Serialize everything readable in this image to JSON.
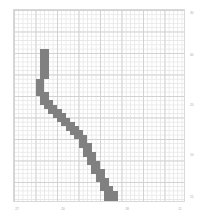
{
  "figure": {
    "background_color": "#ffffff",
    "plot_border_color": "#d9d9d9"
  },
  "chart_data": {
    "type": "heatmap",
    "title": "",
    "subtitle": "",
    "xlabel": "",
    "ylabel": "",
    "grid": true,
    "grid_minor_cell_px": 4.3,
    "grid_major_every": 5,
    "legend": null,
    "legend_position": "none",
    "fill_color": "#808080",
    "empty_color": "#ffffff",
    "annotation": "pixelated y-shaped glyph rendered as filled grid bins",
    "xlim": [
      27,
      11
    ],
    "ylim": [
      15,
      30
    ],
    "x_ticks": [
      {
        "label": "27",
        "value": 27,
        "px": 17
      },
      {
        "label": "20",
        "value": 20,
        "px": 63
      },
      {
        "label": "18",
        "value": 18,
        "px": 127
      },
      {
        "label": "11",
        "value": 11,
        "px": 180
      }
    ],
    "y_ticks": [
      {
        "label": "30",
        "value": 30,
        "px": 13
      },
      {
        "label": "40",
        "value": 40,
        "px": 55
      },
      {
        "label": "20",
        "value": 20,
        "px": 105
      },
      {
        "label": "10",
        "value": 10,
        "px": 155
      },
      {
        "label": "15",
        "value": 15,
        "px": 197
      }
    ],
    "grid_cols": 40,
    "grid_rows": 45,
    "cell_w": 4.3,
    "cell_h": 4.3,
    "filled_cells": [
      [
        55,
        14
      ],
      [
        55,
        15
      ],
      [
        55,
        16
      ],
      [
        54,
        14
      ],
      [
        54,
        15
      ],
      [
        54,
        16
      ],
      [
        53,
        14
      ],
      [
        53,
        15
      ],
      [
        53,
        16
      ],
      [
        53,
        17
      ],
      [
        52,
        15
      ],
      [
        52,
        16
      ],
      [
        52,
        17
      ],
      [
        52,
        18
      ],
      [
        51,
        16
      ],
      [
        51,
        17
      ],
      [
        51,
        18
      ],
      [
        50,
        16
      ],
      [
        50,
        17
      ],
      [
        50,
        18
      ],
      [
        49,
        17
      ],
      [
        49,
        18
      ],
      [
        49,
        19
      ],
      [
        48,
        18
      ],
      [
        48,
        19
      ],
      [
        48,
        20
      ],
      [
        47,
        19
      ],
      [
        47,
        20
      ],
      [
        46,
        19
      ],
      [
        46,
        20
      ],
      [
        46,
        21
      ],
      [
        45,
        20
      ],
      [
        45,
        21
      ],
      [
        45,
        22
      ],
      [
        44,
        21
      ],
      [
        44,
        22
      ],
      [
        43,
        21
      ],
      [
        43,
        22
      ],
      [
        43,
        23
      ],
      [
        56,
        28
      ],
      [
        56,
        29
      ],
      [
        56,
        30
      ],
      [
        55,
        28
      ],
      [
        55,
        29
      ],
      [
        55,
        30
      ],
      [
        54,
        27
      ],
      [
        54,
        28
      ],
      [
        54,
        29
      ],
      [
        54,
        30
      ],
      [
        53,
        27
      ],
      [
        53,
        28
      ],
      [
        53,
        29
      ],
      [
        52,
        26
      ],
      [
        52,
        27
      ],
      [
        52,
        28
      ],
      [
        51,
        26
      ],
      [
        51,
        27
      ],
      [
        50,
        25
      ],
      [
        50,
        26
      ],
      [
        50,
        27
      ],
      [
        49,
        24
      ],
      [
        49,
        25
      ],
      [
        49,
        26
      ],
      [
        48,
        24
      ],
      [
        48,
        25
      ],
      [
        47,
        23
      ],
      [
        47,
        24
      ],
      [
        47,
        25
      ],
      [
        46,
        23
      ],
      [
        46,
        24
      ],
      [
        45,
        22
      ],
      [
        45,
        23
      ],
      [
        45,
        24
      ],
      [
        44,
        22
      ],
      [
        44,
        23
      ],
      [
        42,
        21
      ],
      [
        42,
        22
      ],
      [
        42,
        23
      ],
      [
        41,
        20
      ],
      [
        41,
        21
      ],
      [
        41,
        22
      ],
      [
        40,
        20
      ],
      [
        40,
        21
      ],
      [
        39,
        19
      ],
      [
        39,
        20
      ],
      [
        39,
        21
      ],
      [
        38,
        19
      ],
      [
        38,
        20
      ],
      [
        37,
        18
      ],
      [
        37,
        19
      ],
      [
        37,
        20
      ],
      [
        36,
        18
      ],
      [
        36,
        19
      ],
      [
        35,
        17
      ],
      [
        35,
        18
      ],
      [
        35,
        19
      ],
      [
        34,
        17
      ],
      [
        34,
        18
      ],
      [
        33,
        16
      ],
      [
        33,
        17
      ],
      [
        33,
        18
      ],
      [
        32,
        16
      ],
      [
        32,
        17
      ],
      [
        31,
        15
      ],
      [
        31,
        16
      ],
      [
        31,
        17
      ],
      [
        30,
        15
      ],
      [
        30,
        16
      ],
      [
        29,
        14
      ],
      [
        29,
        15
      ],
      [
        29,
        16
      ],
      [
        28,
        13
      ],
      [
        28,
        14
      ],
      [
        28,
        15
      ],
      [
        27,
        12
      ],
      [
        27,
        13
      ],
      [
        27,
        14
      ],
      [
        26,
        11
      ],
      [
        26,
        12
      ],
      [
        26,
        13
      ],
      [
        25,
        10
      ],
      [
        25,
        11
      ],
      [
        25,
        12
      ],
      [
        24,
        9
      ],
      [
        24,
        10
      ],
      [
        24,
        11
      ],
      [
        23,
        8
      ],
      [
        23,
        9
      ],
      [
        23,
        10
      ],
      [
        22,
        7
      ],
      [
        22,
        8
      ],
      [
        22,
        9
      ],
      [
        21,
        6
      ],
      [
        21,
        7
      ],
      [
        21,
        8
      ],
      [
        20,
        6
      ],
      [
        20,
        7
      ],
      [
        19,
        5
      ],
      [
        19,
        6
      ],
      [
        19,
        7
      ],
      [
        18,
        5
      ],
      [
        18,
        6
      ],
      [
        17,
        5
      ],
      [
        17,
        6
      ],
      [
        16,
        5
      ],
      [
        16,
        6
      ],
      [
        15,
        6
      ],
      [
        15,
        7
      ],
      [
        14,
        6
      ],
      [
        14,
        7
      ],
      [
        13,
        6
      ],
      [
        13,
        7
      ],
      [
        12,
        6
      ],
      [
        12,
        7
      ],
      [
        11,
        6
      ],
      [
        11,
        7
      ],
      [
        10,
        6
      ],
      [
        10,
        7
      ],
      [
        9,
        6
      ],
      [
        9,
        7
      ]
    ]
  }
}
